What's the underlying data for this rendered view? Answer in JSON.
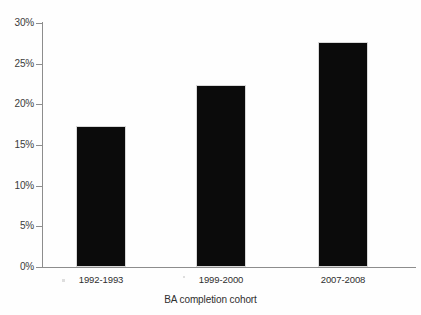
{
  "chart_data": {
    "type": "bar",
    "title": "",
    "subtitle": "",
    "xlabel": "BA completion cohort",
    "ylabel": "",
    "categories": [
      "1992-1993",
      "1999-2000",
      "2007-2008"
    ],
    "values": [
      17.3,
      22.4,
      27.7
    ],
    "value_labels": [
      "17%",
      "22%",
      "28%"
    ],
    "ylim": [
      0,
      30
    ],
    "yticks": [
      0,
      5,
      10,
      15,
      20,
      25,
      30
    ],
    "ytick_labels": [
      "0%",
      "5%",
      "10%",
      "15%",
      "20%",
      "25%",
      "30%"
    ],
    "grid": false,
    "legend": null,
    "bar_color": "#0b0b0b",
    "axis_color": "#8d8d8d",
    "background_color": "#fefefe"
  },
  "axis": {
    "y": {
      "ticks": [
        {
          "label": "30%",
          "value": 30
        },
        {
          "label": "25%",
          "value": 25
        },
        {
          "label": "20%",
          "value": 20
        },
        {
          "label": "15%",
          "value": 15
        },
        {
          "label": "10%",
          "value": 10
        },
        {
          "label": "5%",
          "value": 5
        },
        {
          "label": "0%",
          "value": 0
        }
      ]
    },
    "x": {
      "title": "BA completion cohort",
      "ticks": [
        {
          "label": "1992-1993"
        },
        {
          "label": "1999-2000"
        },
        {
          "label": "2007-2008"
        }
      ]
    }
  }
}
